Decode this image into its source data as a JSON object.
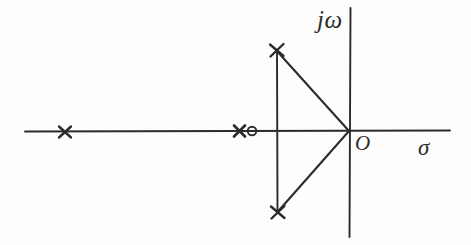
{
  "figure": {
    "kind": "pole-zero-plot",
    "background_color": "#fdfdfc",
    "ink_color": "#2b2b2b",
    "width": 471,
    "height": 245
  },
  "labels": {
    "imaginary_axis": "jω",
    "origin": "O",
    "real_axis": "σ"
  },
  "chart_data": {
    "type": "scatter",
    "title": "",
    "xlabel": "σ",
    "ylabel": "jω",
    "grid": false,
    "legend": null,
    "axes": {
      "origin_px": {
        "x": 349,
        "y": 131
      },
      "real_axis_px": {
        "x1": 25,
        "y1": 131,
        "x2": 450,
        "y2": 131
      },
      "imaginary_axis_px": {
        "x": 350,
        "y1": 8,
        "y2": 237
      }
    },
    "series": [
      {
        "name": "poles",
        "marker": "x",
        "count": 4,
        "points_px": [
          {
            "x": 65,
            "y": 132
          },
          {
            "x": 240,
            "y": 131
          },
          {
            "x": 276,
            "y": 50
          },
          {
            "x": 277,
            "y": 212
          }
        ]
      },
      {
        "name": "zeros",
        "marker": "o",
        "count": 1,
        "points_px": [
          {
            "x": 252,
            "y": 131
          }
        ]
      }
    ],
    "construction_lines": [
      {
        "name": "vertical-chord",
        "x1": 277,
        "y1": 50,
        "x2": 277,
        "y2": 212
      },
      {
        "name": "upper-pole-to-origin",
        "x1": 276,
        "y1": 50,
        "x2": 349,
        "y2": 131
      },
      {
        "name": "lower-pole-to-origin",
        "x1": 277,
        "y1": 212,
        "x2": 349,
        "y2": 131
      }
    ]
  }
}
